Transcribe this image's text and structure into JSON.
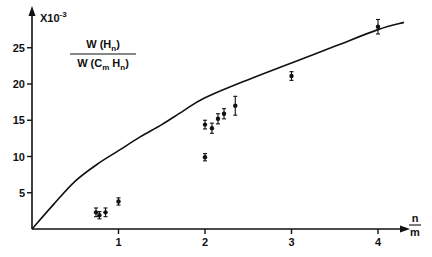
{
  "chart_data": {
    "type": "scatter",
    "title": "",
    "ylabel_formula": {
      "numerator": "W(Hn)",
      "denominator": "W(Cm Hn)"
    },
    "y_unit": "X10-3",
    "xlabel": "n/m",
    "xlim": [
      0,
      4.3
    ],
    "ylim": [
      0,
      29
    ],
    "x_ticks": [
      1,
      2,
      3,
      4
    ],
    "y_ticks": [
      5,
      10,
      15,
      20,
      25
    ],
    "grid": false,
    "legend": null,
    "series": [
      {
        "name": "measured",
        "kind": "points_with_error_bars",
        "points": [
          {
            "x": 0.74,
            "y": 2.3,
            "err": 0.6
          },
          {
            "x": 0.78,
            "y": 1.9,
            "err": 0.5
          },
          {
            "x": 0.85,
            "y": 2.3,
            "err": 0.6
          },
          {
            "x": 1.0,
            "y": 3.8,
            "err": 0.5
          },
          {
            "x": 2.0,
            "y": 9.9,
            "err": 0.5
          },
          {
            "x": 2.0,
            "y": 14.4,
            "err": 0.6
          },
          {
            "x": 2.08,
            "y": 13.9,
            "err": 0.7
          },
          {
            "x": 2.15,
            "y": 15.2,
            "err": 0.7
          },
          {
            "x": 2.22,
            "y": 15.9,
            "err": 0.7
          },
          {
            "x": 2.35,
            "y": 17.0,
            "err": 1.3
          },
          {
            "x": 3.0,
            "y": 21.1,
            "err": 0.6
          },
          {
            "x": 4.0,
            "y": 27.9,
            "err": 1.0
          }
        ]
      },
      {
        "name": "theory",
        "kind": "curve",
        "x": [
          0,
          0.25,
          0.5,
          0.75,
          1.0,
          1.25,
          1.5,
          1.75,
          2.0,
          2.5,
          3.0,
          3.5,
          4.0,
          4.3
        ],
        "y": [
          0,
          3.4,
          6.6,
          8.9,
          10.8,
          12.7,
          14.4,
          16.3,
          18.1,
          20.6,
          22.9,
          25.2,
          27.5,
          28.5
        ]
      }
    ]
  }
}
